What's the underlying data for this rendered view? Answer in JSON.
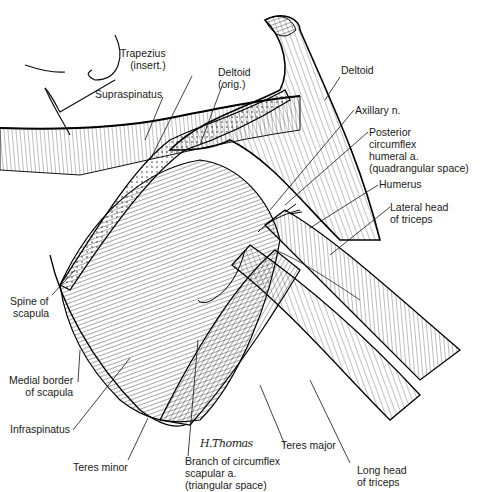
{
  "diagram": {
    "colors": {
      "ink": "#1a1a1a",
      "background": "#ffffff"
    },
    "signature": "H.Thomas",
    "labels": [
      {
        "id": "trapezius",
        "lines": [
          "Trapezius",
          "(insert.)"
        ]
      },
      {
        "id": "deltoid-orig",
        "lines": [
          "Deltoid",
          "(orig.)"
        ]
      },
      {
        "id": "supraspinatus",
        "lines": [
          "Supraspinatus"
        ]
      },
      {
        "id": "deltoid",
        "lines": [
          "Deltoid"
        ]
      },
      {
        "id": "axillary-n",
        "lines": [
          "Axillary n."
        ]
      },
      {
        "id": "posterior-circumflex",
        "lines": [
          "Posterior",
          "circumflex",
          "humeral a.",
          "(quadrangular space)"
        ]
      },
      {
        "id": "humerus",
        "lines": [
          "Humerus"
        ]
      },
      {
        "id": "lateral-head-triceps",
        "lines": [
          "Lateral head",
          "of triceps"
        ]
      },
      {
        "id": "spine-of-scapula",
        "lines": [
          "Spine of",
          "scapula"
        ]
      },
      {
        "id": "medial-border-scapula",
        "lines": [
          "Medial border",
          "of scapula"
        ]
      },
      {
        "id": "infraspinatus",
        "lines": [
          "Infraspinatus"
        ]
      },
      {
        "id": "teres-minor",
        "lines": [
          "Teres minor"
        ]
      },
      {
        "id": "branch-circumflex-scapular",
        "lines": [
          "Branch of circumflex",
          "scapular a.",
          "(triangular space)"
        ]
      },
      {
        "id": "teres-major",
        "lines": [
          "Teres major"
        ]
      },
      {
        "id": "long-head-triceps",
        "lines": [
          "Long head",
          "of triceps"
        ]
      }
    ]
  }
}
